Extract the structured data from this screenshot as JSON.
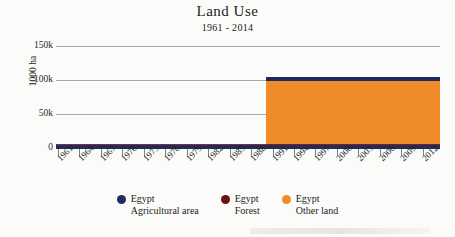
{
  "chart_data": {
    "type": "area",
    "title": "Land Use",
    "subtitle": "1961 - 2014",
    "xlabel": "",
    "ylabel": "1000 ha",
    "ylim": [
      0,
      150000
    ],
    "yticks": [
      "0",
      "50k",
      "100k",
      "150k"
    ],
    "grid": true,
    "legend_position": "bottom",
    "x_range": [
      1961,
      2014
    ],
    "categories": [
      "1961",
      "1964",
      "1967",
      "1970",
      "1973",
      "1976",
      "1979",
      "1982",
      "1985",
      "1988",
      "1991",
      "1994",
      "1997",
      "2000",
      "2003",
      "2006",
      "2009",
      "2012"
    ],
    "series": [
      {
        "name": "Egypt Agricultural area",
        "country": "Egypt",
        "metric": "Agricultural area",
        "color": "#1f2c5c",
        "values": [
          2500,
          2600,
          2700,
          2750,
          2800,
          2850,
          2900,
          2950,
          3000,
          3100,
          3200,
          3300,
          3400,
          3450,
          3500,
          3600,
          3700,
          3800
        ]
      },
      {
        "name": "Egypt Forest",
        "country": "Egypt",
        "metric": "Forest",
        "color": "#6e0d14",
        "values": [
          50,
          52,
          54,
          56,
          58,
          60,
          62,
          64,
          66,
          68,
          60,
          62,
          64,
          66,
          68,
          70,
          70,
          70
        ]
      },
      {
        "name": "Egypt Other land",
        "country": "Egypt",
        "metric": "Other land",
        "color": "#ef8b28",
        "values": [
          0,
          0,
          0,
          0,
          0,
          0,
          0,
          0,
          0,
          0,
          96000,
          96000,
          96000,
          96000,
          96000,
          96000,
          96000,
          96000
        ]
      }
    ]
  },
  "legend": {
    "items": [
      {
        "country": "Egypt",
        "metric": "Agricultural area",
        "color": "#1f2c5c"
      },
      {
        "country": "Egypt",
        "metric": "Forest",
        "color": "#6e0d14"
      },
      {
        "country": "Egypt",
        "metric": "Other land",
        "color": "#ef8b28"
      }
    ]
  },
  "axes": {
    "y": {
      "title": "1000 ha",
      "ticks": [
        "150k",
        "100k",
        "50k",
        "0"
      ]
    },
    "x": {
      "ticks": [
        "1961",
        "1964",
        "1967",
        "1970",
        "1973",
        "1976",
        "1979",
        "1982",
        "1985",
        "1988",
        "1991",
        "1994",
        "1997",
        "2000",
        "2003",
        "2006",
        "2009",
        "2012"
      ]
    }
  }
}
